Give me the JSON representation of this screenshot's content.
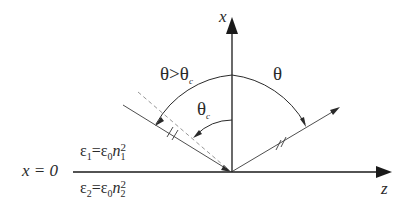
{
  "diagram": {
    "axes": {
      "vertical_label": "x",
      "horizontal_label": "z",
      "interface_label": "x = 0"
    },
    "angles": {
      "theta": "θ",
      "theta_gt_critical": "θ>θ",
      "theta_gt_critical_sub": "c",
      "theta_critical": "θ",
      "theta_critical_sub": "c"
    },
    "media": {
      "upper": {
        "eps": "ε",
        "eps_sub": "1",
        "eq": "=",
        "eps0": "ε",
        "eps0_sub": "0",
        "n": "n",
        "n_sub": "1",
        "power": "2"
      },
      "lower": {
        "eps": "ε",
        "eps_sub": "2",
        "eq": "=",
        "eps0": "ε",
        "eps0_sub": "0",
        "n": "n",
        "n_sub": "2",
        "power": "2"
      }
    },
    "colors": {
      "line": "#2a2a2a",
      "dashed": "#888888",
      "background": "#ffffff"
    }
  }
}
